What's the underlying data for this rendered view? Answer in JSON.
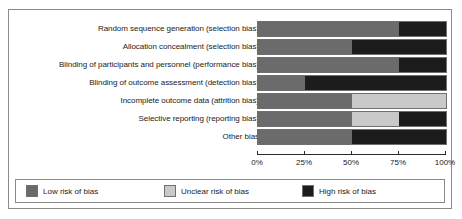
{
  "chart_data": {
    "type": "bar",
    "orientation": "horizontal",
    "stacked": true,
    "normalized_percent": true,
    "title": "",
    "xlabel": "",
    "ylabel": "",
    "xlim": [
      0,
      100
    ],
    "grid": false,
    "legend_position": "bottom",
    "categories": [
      "Random sequence generation (selection bias)",
      "Allocation concealment (selection bias)",
      "Blinding of participants and personnel (performance bias)",
      "Blinding of outcome assessment (detection bias)",
      "Incomplete outcome data (attrition bias)",
      "Selective reporting (reporting bias)",
      "Other bias"
    ],
    "series": [
      {
        "name": "Low risk of bias",
        "color": "#6b6b6b",
        "values": [
          75,
          50,
          75,
          25,
          50,
          50,
          50
        ]
      },
      {
        "name": "Unclear risk of bias",
        "color": "#c9c9c9",
        "values": [
          0,
          0,
          0,
          0,
          50,
          25,
          0
        ]
      },
      {
        "name": "High risk of bias",
        "color": "#1c1c1c",
        "values": [
          25,
          50,
          25,
          75,
          0,
          25,
          50
        ]
      }
    ],
    "xticks": [
      0,
      25,
      50,
      75,
      100
    ],
    "xtick_labels": [
      "0%",
      "25%",
      "50%",
      "75%",
      "100%"
    ]
  },
  "legend": {
    "items": [
      {
        "label": "Low risk of bias",
        "color": "#6b6b6b",
        "swatch_name": "legend-swatch-low-risk"
      },
      {
        "label": "Unclear risk of bias",
        "color": "#c9c9c9",
        "swatch_name": "legend-swatch-unclear-risk"
      },
      {
        "label": "High risk of bias",
        "color": "#1c1c1c",
        "swatch_name": "legend-swatch-high-risk"
      }
    ]
  }
}
